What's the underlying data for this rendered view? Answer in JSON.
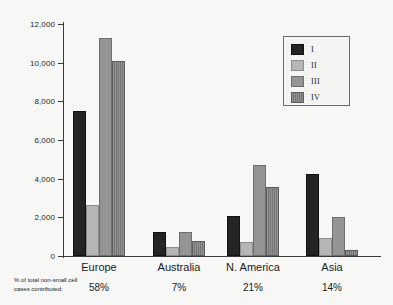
{
  "chart_data": {
    "type": "bar",
    "title": "",
    "xlabel": "",
    "ylabel": "",
    "ylim": [
      0,
      12000
    ],
    "yticks": [
      0,
      2000,
      4000,
      6000,
      8000,
      10000,
      12000
    ],
    "ytick_labels": [
      "0",
      "2,000",
      "4,000",
      "6,000",
      "8,000",
      "10,000",
      "12,000"
    ],
    "grid": false,
    "legend_position": "top-right",
    "categories": [
      "Europe",
      "Australia",
      "N. America",
      "Asia"
    ],
    "series": [
      {
        "name": "I",
        "values": [
          7500,
          1250,
          2050,
          4250
        ]
      },
      {
        "name": "II",
        "values": [
          2650,
          480,
          750,
          950
        ]
      },
      {
        "name": "III",
        "values": [
          11300,
          1250,
          4700,
          2000
        ]
      },
      {
        "name": "IV",
        "values": [
          10100,
          780,
          3550,
          320
        ]
      }
    ],
    "annotations": {
      "footnote_line1": "% of total non-small cell",
      "footnote_line2": "cases contributed:",
      "category_percentages": [
        "58%",
        "7%",
        "21%",
        "14%"
      ]
    }
  },
  "legend": {
    "entries": [
      {
        "label": "I",
        "color": "#242424"
      },
      {
        "label": "II",
        "color": "#b6b6b6"
      },
      {
        "label": "III",
        "color": "#949494"
      },
      {
        "label": "IV",
        "color": "#7d7d7d"
      }
    ]
  },
  "colors": {
    "background": "#f7f7f5",
    "axis": "#3a3a3a",
    "text": "#1b1b1b",
    "series_i": "#242424",
    "series_ii": "#b6b6b6",
    "series_iii": "#949494",
    "series_iv": "#7d7d7d"
  }
}
